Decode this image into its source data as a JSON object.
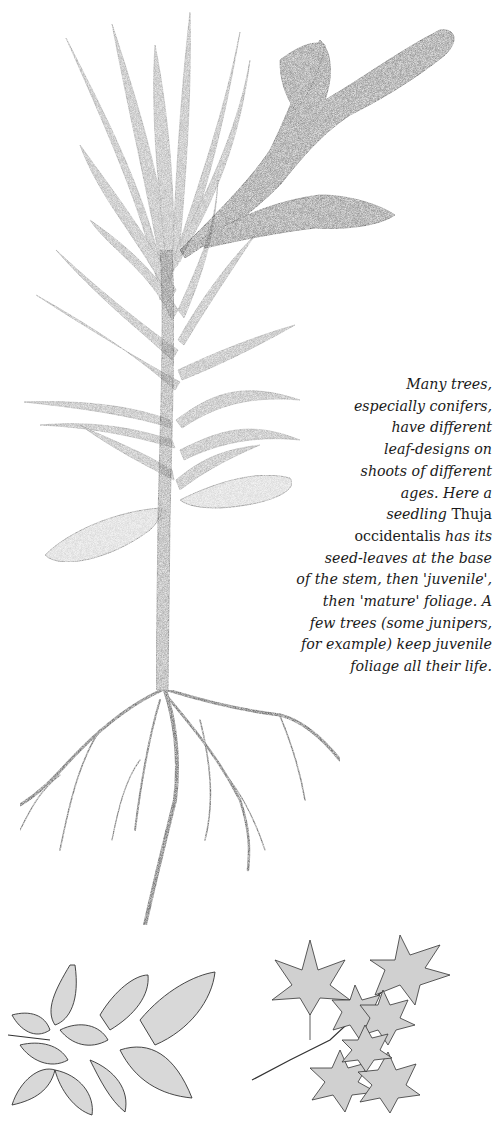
{
  "page": {
    "background": "#ffffff",
    "ink_color": "#1a1a1a"
  },
  "illustrations": [
    {
      "name": "thuja-seedling",
      "description": "Seedling Thuja occidentalis showing seed-leaves at base, juvenile needle foliage, mature scale foliage at top right, and root system"
    },
    {
      "name": "elm-like-leaves",
      "description": "Sprig of serrated toothed leaves with prominent parallel veins (bottom left)"
    },
    {
      "name": "maple-leaves",
      "description": "Sprig of palmately lobed maple leaves (bottom right)"
    }
  ],
  "caption": {
    "lines": [
      [
        {
          "t": "Many trees,",
          "s": "it"
        }
      ],
      [
        {
          "t": "especially conifers,",
          "s": "it"
        }
      ],
      [
        {
          "t": "have different",
          "s": "it"
        }
      ],
      [
        {
          "t": "leaf-designs on",
          "s": "it"
        }
      ],
      [
        {
          "t": "shoots of different",
          "s": "it"
        }
      ],
      [
        {
          "t": "ages. Here a",
          "s": "it"
        }
      ],
      [
        {
          "t": "seedling ",
          "s": "it"
        },
        {
          "t": "Thuja",
          "s": "rm"
        }
      ],
      [
        {
          "t": "occidentalis ",
          "s": "rm"
        },
        {
          "t": "has its",
          "s": "it"
        }
      ],
      [
        {
          "t": "seed-leaves at the base",
          "s": "it"
        }
      ],
      [
        {
          "t": "of the stem, then 'juvenile',",
          "s": "it"
        }
      ],
      [
        {
          "t": "then 'mature' foliage. A",
          "s": "it"
        }
      ],
      [
        {
          "t": "few trees (some junipers,",
          "s": "it"
        }
      ],
      [
        {
          "t": "for example) keep juvenile",
          "s": "it"
        }
      ],
      [
        {
          "t": "foliage all their life.",
          "s": "it"
        }
      ]
    ]
  }
}
